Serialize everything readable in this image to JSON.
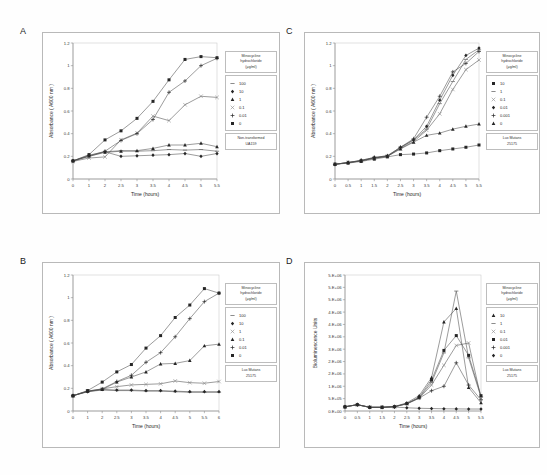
{
  "figure": {
    "legend_title": "Minocycline hydrochloride (µg/ml)",
    "legend_title_lines": [
      "Minocycline",
      "hydrochloride",
      "(µg/ml)"
    ],
    "strain_ua159_lines": [
      "Non-transformed",
      "UA159"
    ],
    "strain_lux_lines": [
      "Lux Mutans",
      "25175"
    ],
    "xlabel": "Time (hours)",
    "ylabel_absorbance": "Absorbance ( A600 nm )",
    "ylabel_bioluminescence": "Bioluminescence Units"
  },
  "panels": [
    {
      "letter": "A",
      "strain_lines": [
        "Non-transformed",
        "UA159"
      ],
      "chart_data": {
        "type": "line",
        "title": "",
        "xlabel": "Time (hours)",
        "ylabel": "Absorbance ( A600 nm )",
        "x": [
          0,
          1,
          2,
          2.5,
          3,
          3.5,
          4,
          4.5,
          5,
          5.5
        ],
        "xticklabels": [
          "0",
          "1",
          "2",
          "2.5",
          "3",
          "3.5",
          "4",
          "4.5",
          "5",
          "5.5"
        ],
        "ylim": [
          0,
          1.2
        ],
        "yticks": [
          0,
          0.2,
          0.4,
          0.6,
          0.8,
          1,
          1.2
        ],
        "yticklabels": [
          "0",
          "0.2",
          "0.4",
          "0.6",
          "0.8",
          "1",
          "1.2"
        ],
        "grid": false,
        "legend_position": "right",
        "series": [
          {
            "name": "100",
            "marker": "dash",
            "values": [
              0.16,
              0.2,
              0.24,
              0.25,
              0.245,
              0.25,
              0.26,
              0.255,
              0.26,
              0.245
            ]
          },
          {
            "name": "10",
            "marker": "diamond",
            "values": [
              0.16,
              0.21,
              0.24,
              0.2,
              0.205,
              0.21,
              0.215,
              0.225,
              0.2,
              0.225
            ]
          },
          {
            "name": "1",
            "marker": "triangle",
            "values": [
              0.16,
              0.2,
              0.235,
              0.245,
              0.25,
              0.27,
              0.3,
              0.3,
              0.315,
              0.285
            ]
          },
          {
            "name": "0.1",
            "marker": "tick",
            "values": [
              0.155,
              0.185,
              0.195,
              0.345,
              0.405,
              0.555,
              0.515,
              0.655,
              0.73,
              0.72
            ]
          },
          {
            "name": "0.01",
            "marker": "plus",
            "values": [
              0.16,
              0.205,
              0.245,
              0.34,
              0.4,
              0.525,
              0.765,
              0.865,
              1.0,
              1.065
            ]
          },
          {
            "name": "0",
            "marker": "square",
            "values": [
              0.16,
              0.215,
              0.345,
              0.425,
              0.535,
              0.685,
              0.875,
              1.055,
              1.08,
              1.07
            ]
          }
        ]
      }
    },
    {
      "letter": "B",
      "strain_lines": [
        "Lux Mutans",
        "25175"
      ],
      "chart_data": {
        "type": "line",
        "title": "",
        "xlabel": "Time (hours)",
        "ylabel": "Absorbance ( A600 nm )",
        "x": [
          0,
          1,
          2,
          2.5,
          3,
          3.5,
          4,
          4.5,
          5,
          5.5,
          6
        ],
        "xticklabels": [
          "0",
          "1",
          "2",
          "2.5",
          "3",
          "3.5",
          "4",
          "4.5",
          "5",
          "5.5",
          "6"
        ],
        "ylim": [
          0,
          1.2
        ],
        "yticks": [
          0,
          0.2,
          0.4,
          0.6,
          0.8,
          1,
          1.2
        ],
        "yticklabels": [
          "0",
          "0.2",
          "0.4",
          "0.6",
          "0.8",
          "1",
          "1.2"
        ],
        "grid": false,
        "legend_position": "right",
        "series": [
          {
            "name": "100",
            "marker": "dash",
            "values": [
              0.135,
              0.17,
              0.185,
              0.18,
              0.18,
              0.175,
              0.175,
              0.17,
              0.165,
              0.165,
              0.165
            ]
          },
          {
            "name": "10",
            "marker": "diamond",
            "values": [
              0.135,
              0.17,
              0.19,
              0.185,
              0.185,
              0.18,
              0.18,
              0.175,
              0.17,
              0.17,
              0.17
            ]
          },
          {
            "name": "1",
            "marker": "tick",
            "values": [
              0.135,
              0.175,
              0.195,
              0.215,
              0.23,
              0.235,
              0.24,
              0.265,
              0.25,
              0.245,
              0.26
            ]
          },
          {
            "name": "0.1",
            "marker": "triangle",
            "values": [
              0.135,
              0.175,
              0.19,
              0.255,
              0.3,
              0.345,
              0.415,
              0.42,
              0.445,
              0.575,
              0.59
            ]
          },
          {
            "name": "0.01",
            "marker": "plus",
            "values": [
              0.135,
              0.175,
              0.195,
              0.26,
              0.315,
              0.43,
              0.515,
              0.655,
              0.815,
              0.965,
              1.04
            ]
          },
          {
            "name": "0",
            "marker": "square",
            "values": [
              0.135,
              0.18,
              0.255,
              0.345,
              0.41,
              0.555,
              0.665,
              0.825,
              0.935,
              1.08,
              1.04
            ]
          }
        ]
      }
    },
    {
      "letter": "C",
      "strain_lines": [
        "Lux Mutans",
        "25175"
      ],
      "chart_data": {
        "type": "line",
        "title": "",
        "xlabel": "Time (hours)",
        "ylabel": "Absorbance ( A600 nm )",
        "x": [
          0,
          0.5,
          1,
          1.5,
          2,
          2.5,
          3,
          3.5,
          4,
          4.5,
          5,
          5.5
        ],
        "xticklabels": [
          "0",
          "0.5",
          "1",
          "1.5",
          "2",
          "2.5",
          "3",
          "3.5",
          "4",
          "4.5",
          "5",
          "5.5"
        ],
        "ylim": [
          0,
          1.2
        ],
        "yticks": [
          0,
          0.2,
          0.4,
          0.6,
          0.8,
          1,
          1.2
        ],
        "yticklabels": [
          "0",
          "0.2",
          "0.4",
          "0.6",
          "0.8",
          "1",
          "1.2"
        ],
        "grid": false,
        "legend_position": "right",
        "series": [
          {
            "name": "10",
            "marker": "square",
            "values": [
              0.13,
              0.14,
              0.155,
              0.175,
              0.195,
              0.215,
              0.22,
              0.23,
              0.25,
              0.265,
              0.28,
              0.3
            ]
          },
          {
            "name": "1",
            "marker": "dash",
            "values": [
              0.13,
              0.145,
              0.16,
              0.185,
              0.2,
              0.275,
              0.345,
              0.44,
              0.665,
              0.86,
              1.055,
              1.14
            ]
          },
          {
            "name": "0.1",
            "marker": "tick",
            "values": [
              0.13,
              0.145,
              0.16,
              0.185,
              0.2,
              0.27,
              0.33,
              0.43,
              0.575,
              0.79,
              0.965,
              1.05
            ]
          },
          {
            "name": "0.01",
            "marker": "diamond",
            "values": [
              0.13,
              0.145,
              0.165,
              0.19,
              0.205,
              0.28,
              0.345,
              0.465,
              0.695,
              0.915,
              1.09,
              1.155
            ]
          },
          {
            "name": "0.001",
            "marker": "plus",
            "values": [
              0.13,
              0.145,
              0.165,
              0.19,
              0.205,
              0.28,
              0.355,
              0.545,
              0.73,
              0.945,
              1.02,
              1.125
            ]
          },
          {
            "name": "0",
            "marker": "triangle",
            "values": [
              0.13,
              0.145,
              0.16,
              0.185,
              0.2,
              0.265,
              0.325,
              0.385,
              0.405,
              0.44,
              0.465,
              0.485
            ]
          }
        ]
      }
    },
    {
      "letter": "D",
      "strain_lines": [
        "Lux Mutans",
        "25175"
      ],
      "chart_data": {
        "type": "line",
        "title": "",
        "xlabel": "Time (hours)",
        "ylabel": "Bioluminescence Units",
        "x": [
          0,
          0.5,
          1,
          1.5,
          2,
          2.5,
          3,
          3.5,
          4,
          4.5,
          5,
          5.5
        ],
        "xticklabels": [
          "0",
          "0.5",
          "1",
          "1.5",
          "2",
          "2.5",
          "3",
          "3.5",
          "4",
          "4.5",
          "5",
          "5.5"
        ],
        "ylim": [
          0,
          5500000
        ],
        "yticks": [
          0,
          500000,
          1000000,
          1500000,
          2000000,
          2500000,
          3000000,
          3500000,
          4000000,
          4500000,
          5000000,
          5500000
        ],
        "yticklabels": [
          "0.E+00",
          "5.E+05",
          "1.E+06",
          "2.E+06",
          "2.E+06",
          "3.E+06",
          "3.E+06",
          "4.E+06",
          "4.E+06",
          "5.E+06",
          "5.E+06",
          "5.E+06"
        ],
        "grid": false,
        "legend_position": "right",
        "series": [
          {
            "name": "10",
            "marker": "triangle",
            "values": [
              170000,
              260000,
              150000,
              150000,
              180000,
              330000,
              620000,
              1350000,
              3600000,
              4150000,
              950000,
              330000
            ]
          },
          {
            "name": "1",
            "marker": "dash",
            "values": [
              170000,
              255000,
              150000,
              150000,
              175000,
              300000,
              540000,
              1150000,
              2350000,
              4850000,
              2150000,
              560000
            ]
          },
          {
            "name": "0.1",
            "marker": "tick",
            "values": [
              170000,
              255000,
              150000,
              150000,
              175000,
              290000,
              520000,
              1050000,
              1850000,
              2650000,
              2750000,
              520000
            ]
          },
          {
            "name": "0.01",
            "marker": "square",
            "values": [
              170000,
              255000,
              150000,
              150000,
              175000,
              300000,
              560000,
              1250000,
              2450000,
              3050000,
              2250000,
              620000
            ]
          },
          {
            "name": "0.001",
            "marker": "plus",
            "values": [
              170000,
              255000,
              150000,
              150000,
              175000,
              290000,
              520000,
              820000,
              1000000,
              1950000,
              1050000,
              450000
            ]
          },
          {
            "name": "0",
            "marker": "diamond",
            "values": [
              170000,
              250000,
              145000,
              145000,
              160000,
              130000,
              110000,
              100000,
              90000,
              85000,
              80000,
              80000
            ]
          }
        ]
      }
    }
  ]
}
